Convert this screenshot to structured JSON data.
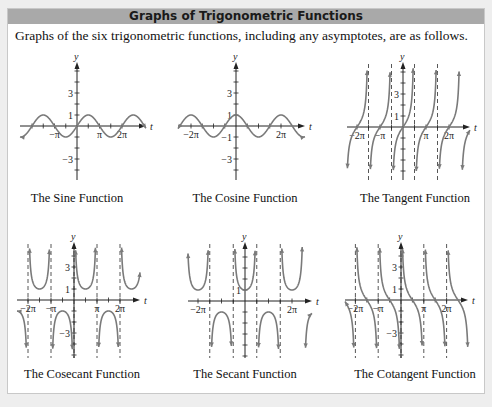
{
  "panel": {
    "title": "Graphs of Trigonometric Functions",
    "intro": "Graphs of the six trigonometric functions, including any asymptotes, are as follows."
  },
  "colors": {
    "header_bg": "#a9a9a9",
    "curve": "#7a7a7a",
    "axis": "#222222",
    "asymptote": "#444444",
    "page_bg": "#eeeeee"
  },
  "chart_data": [
    {
      "type": "line",
      "id": "sin",
      "title": "The Sine Function",
      "function": "sin(t)",
      "xlabel": "t",
      "ylabel": "y",
      "x_tick_labels": [
        "-π",
        "π",
        "2π"
      ],
      "y_tick_labels": [
        "3",
        "1",
        "-3"
      ],
      "xlim": [
        -2.2,
        2.2
      ],
      "ylim": [
        -5,
        6
      ],
      "asymptotes": [],
      "key_points": [
        {
          "t": "-π",
          "y": 0
        },
        {
          "t": "-π/2",
          "y": -1
        },
        {
          "t": "0",
          "y": 0
        },
        {
          "t": "π/2",
          "y": 1
        },
        {
          "t": "π",
          "y": 0
        },
        {
          "t": "3π/2",
          "y": -1
        },
        {
          "t": "2π",
          "y": 0
        }
      ]
    },
    {
      "type": "line",
      "id": "cos",
      "title": "The Cosine Function",
      "function": "cos(t)",
      "xlabel": "t",
      "ylabel": "y",
      "x_tick_labels": [
        "-2π",
        "2π"
      ],
      "y_tick_labels": [
        "3",
        "1",
        "-1",
        "-3"
      ],
      "xlim": [
        -2.2,
        2.2
      ],
      "ylim": [
        -5,
        6
      ],
      "asymptotes": [],
      "key_points": [
        {
          "t": "-2π",
          "y": 1
        },
        {
          "t": "-π",
          "y": -1
        },
        {
          "t": "0",
          "y": 1
        },
        {
          "t": "π",
          "y": -1
        },
        {
          "t": "2π",
          "y": 1
        }
      ]
    },
    {
      "type": "line",
      "id": "tan",
      "title": "The Tangent Function",
      "function": "tan(t)",
      "xlabel": "t",
      "ylabel": "y",
      "x_tick_labels": [
        "-2π",
        "-π",
        "π",
        "2π"
      ],
      "y_tick_labels": [
        "3",
        "1"
      ],
      "xlim": [
        -2.2,
        2.2
      ],
      "ylim": [
        -5,
        6
      ],
      "asymptotes": [
        "-3π/2",
        "-π/2",
        "π/2",
        "3π/2"
      ]
    },
    {
      "type": "line",
      "id": "csc",
      "title": "The Cosecant Function",
      "function": "csc(t)",
      "xlabel": "t",
      "ylabel": "y",
      "x_tick_labels": [
        "-2π",
        "-π",
        "π",
        "2π"
      ],
      "y_tick_labels": [
        "3",
        "1",
        "-3"
      ],
      "xlim": [
        -2.2,
        2.2
      ],
      "ylim": [
        -5,
        6
      ],
      "asymptotes": [
        "-2π",
        "-π",
        "0",
        "π",
        "2π"
      ]
    },
    {
      "type": "line",
      "id": "sec",
      "title": "The Secant Function",
      "function": "sec(t)",
      "xlabel": "t",
      "ylabel": "y",
      "x_tick_labels": [
        "-2π",
        "2π"
      ],
      "y_tick_labels": [
        "1"
      ],
      "xlim": [
        -2.2,
        2.2
      ],
      "ylim": [
        -5,
        6
      ],
      "asymptotes": [
        "-3π/2",
        "-π/2",
        "π/2",
        "3π/2"
      ]
    },
    {
      "type": "line",
      "id": "cot",
      "title": "The Cotangent Function",
      "function": "cot(t)",
      "xlabel": "t",
      "ylabel": "y",
      "x_tick_labels": [
        "-2π",
        "-π",
        "π",
        "2π"
      ],
      "y_tick_labels": [
        "3",
        "1",
        "-3"
      ],
      "xlim": [
        -2.2,
        2.2
      ],
      "ylim": [
        -5,
        6
      ],
      "asymptotes": [
        "-2π",
        "-π",
        "0",
        "π",
        "2π"
      ]
    }
  ]
}
